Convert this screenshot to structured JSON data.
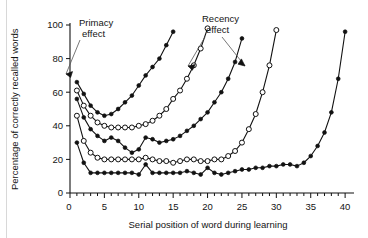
{
  "chart_data": {
    "type": "line",
    "title": "",
    "xlabel": "Serial position of word during learning",
    "ylabel": "Percentage of correctly recalled words",
    "xlim": [
      0,
      41
    ],
    "ylim": [
      0,
      100
    ],
    "xticks_major": [
      0,
      5,
      10,
      15,
      20,
      25,
      30,
      35,
      40
    ],
    "xticks_major_labels": [
      "0",
      "5",
      "10",
      "15",
      "20",
      "25",
      "30",
      "35",
      "40"
    ],
    "xtick_minor_step": 1,
    "yticks": [
      0,
      20,
      40,
      60,
      80,
      100
    ],
    "ytick_labels": [
      "0",
      "20",
      "40",
      "60",
      "80",
      "100"
    ],
    "grid": false,
    "legend_position": "none",
    "annotations": [
      {
        "id": "primacy",
        "label": "Primacy effect",
        "line1": "Primacy",
        "line2": "effect"
      },
      {
        "id": "recency",
        "label": "Recency effect",
        "line1": "Recency",
        "line2": "effect"
      }
    ],
    "series": [
      {
        "name": "List length 15",
        "marker": "filled-circle",
        "x": [
          1,
          2,
          3,
          4,
          5,
          6,
          7,
          8,
          9,
          10,
          11,
          12,
          13,
          14,
          15
        ],
        "values": [
          66,
          59,
          52,
          48,
          46,
          47,
          50,
          54,
          58,
          64,
          70,
          75,
          80,
          88,
          96
        ]
      },
      {
        "name": "List length 20",
        "marker": "open-circle",
        "x": [
          1,
          2,
          3,
          4,
          5,
          6,
          7,
          8,
          9,
          10,
          11,
          12,
          13,
          14,
          15,
          16,
          17,
          18,
          19,
          20
        ],
        "values": [
          61,
          52,
          46,
          42,
          40,
          39,
          39,
          39,
          39,
          40,
          41,
          43,
          46,
          50,
          56,
          61,
          68,
          76,
          86,
          98
        ]
      },
      {
        "name": "List length 25",
        "marker": "filled-circle",
        "x": [
          1,
          2,
          3,
          4,
          5,
          6,
          7,
          8,
          9,
          10,
          11,
          12,
          13,
          14,
          15,
          16,
          17,
          18,
          19,
          20,
          21,
          22,
          23,
          24,
          25
        ],
        "values": [
          56,
          45,
          38,
          34,
          31,
          33,
          31,
          27,
          24,
          26,
          33,
          32,
          30,
          31,
          32,
          34,
          37,
          40,
          44,
          48,
          54,
          60,
          68,
          78,
          92
        ]
      },
      {
        "name": "List length 30",
        "marker": "open-circle",
        "x": [
          1,
          2,
          3,
          4,
          5,
          6,
          7,
          8,
          9,
          10,
          11,
          12,
          13,
          14,
          15,
          16,
          17,
          18,
          19,
          20,
          21,
          22,
          23,
          24,
          25,
          26,
          27,
          28,
          29,
          30
        ],
        "values": [
          46,
          31,
          24,
          21,
          20,
          20,
          20,
          20,
          20,
          20,
          21,
          20,
          19,
          19,
          18,
          19,
          20,
          20,
          19,
          19,
          20,
          20,
          22,
          25,
          30,
          38,
          47,
          60,
          76,
          97
        ]
      },
      {
        "name": "List length 40",
        "marker": "filled-circle",
        "x": [
          1,
          2,
          3,
          4,
          5,
          6,
          7,
          8,
          9,
          10,
          11,
          12,
          13,
          14,
          15,
          16,
          17,
          18,
          19,
          20,
          21,
          22,
          23,
          24,
          25,
          26,
          27,
          28,
          29,
          30,
          31,
          32,
          33,
          34,
          35,
          36,
          37,
          38,
          39,
          40
        ],
        "values": [
          30,
          18,
          12,
          12,
          12,
          12,
          12,
          12,
          12,
          11,
          17,
          12,
          12,
          12,
          12,
          12,
          13,
          12,
          11,
          15,
          12,
          11,
          12,
          13,
          14,
          14,
          15,
          15,
          16,
          16,
          17,
          17,
          16,
          18,
          22,
          28,
          36,
          48,
          68,
          96
        ]
      }
    ]
  },
  "colors": {
    "ink": "#111111",
    "background": "#ffffff",
    "rule": "#d8d8d8",
    "leader": "#555555"
  }
}
